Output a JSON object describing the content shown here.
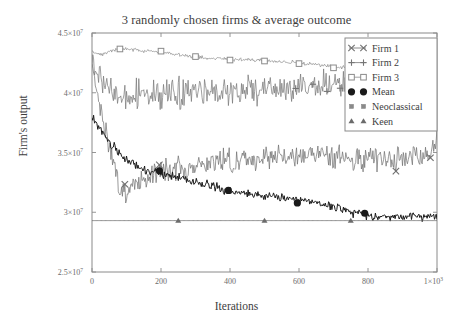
{
  "chart_data": {
    "type": "line",
    "title": "3 randomly chosen firms & average outcome",
    "xlabel": "Iterations",
    "ylabel": "Firm's output",
    "xlim": [
      0,
      1000
    ],
    "ylim": [
      25000000,
      45000000
    ],
    "grid": false,
    "legend_position": "top-right",
    "xticks": [
      0,
      200,
      400,
      600,
      800,
      1000
    ],
    "xtick_labels": [
      "0",
      "200",
      "400",
      "600",
      "800",
      "1×10³"
    ],
    "yticks": [
      25000000,
      30000000,
      35000000,
      40000000,
      45000000
    ],
    "ytick_labels": [
      "2.5×10⁷",
      "3×10⁷",
      "3.5×10⁷",
      "4×10⁷",
      "4.5×10⁷"
    ],
    "series": [
      {
        "name": "Firm 1",
        "marker": "x",
        "color": "#6e6e6e",
        "linewidth": 0.7,
        "noise": 700000,
        "seed": 17,
        "marker_x": [
          95,
          195,
          880,
          980
        ],
        "anchors": [
          {
            "x": 0,
            "y": 42500000
          },
          {
            "x": 40,
            "y": 36500000
          },
          {
            "x": 80,
            "y": 32200000
          },
          {
            "x": 100,
            "y": 31600000
          },
          {
            "x": 140,
            "y": 32600000
          },
          {
            "x": 200,
            "y": 33600000
          },
          {
            "x": 300,
            "y": 33900000
          },
          {
            "x": 400,
            "y": 34300000
          },
          {
            "x": 500,
            "y": 34600000
          },
          {
            "x": 600,
            "y": 34700000
          },
          {
            "x": 700,
            "y": 34600000
          },
          {
            "x": 800,
            "y": 34500000
          },
          {
            "x": 900,
            "y": 34500000
          },
          {
            "x": 980,
            "y": 35000000
          },
          {
            "x": 1000,
            "y": 36500000
          }
        ]
      },
      {
        "name": "Firm 2",
        "marker": "plus",
        "color": "#757575",
        "linewidth": 0.7,
        "noise": 880000,
        "seed": 53,
        "marker_x": [
          590,
          640,
          680,
          720,
          760,
          800,
          840,
          880
        ],
        "anchors": [
          {
            "x": 0,
            "y": 43000000
          },
          {
            "x": 20,
            "y": 41500000
          },
          {
            "x": 60,
            "y": 39800000
          },
          {
            "x": 100,
            "y": 39700000
          },
          {
            "x": 200,
            "y": 39900000
          },
          {
            "x": 300,
            "y": 40000000
          },
          {
            "x": 400,
            "y": 40100000
          },
          {
            "x": 500,
            "y": 40200000
          },
          {
            "x": 600,
            "y": 40500000
          },
          {
            "x": 700,
            "y": 40600000
          },
          {
            "x": 800,
            "y": 40700000
          },
          {
            "x": 900,
            "y": 40700000
          },
          {
            "x": 990,
            "y": 41000000
          },
          {
            "x": 1000,
            "y": 42600000
          }
        ]
      },
      {
        "name": "Firm 3",
        "marker": "square",
        "color": "#8a8a8a",
        "linewidth": 0.7,
        "noise": 110000,
        "seed": 91,
        "marker_x": [
          80,
          200,
          300,
          400,
          500,
          600,
          700,
          770,
          840,
          900,
          950
        ],
        "anchors": [
          {
            "x": 0,
            "y": 43400000
          },
          {
            "x": 30,
            "y": 43200000
          },
          {
            "x": 80,
            "y": 43700000
          },
          {
            "x": 150,
            "y": 43500000
          },
          {
            "x": 200,
            "y": 43400000
          },
          {
            "x": 300,
            "y": 43000000
          },
          {
            "x": 400,
            "y": 42800000
          },
          {
            "x": 500,
            "y": 42700000
          },
          {
            "x": 600,
            "y": 42500000
          },
          {
            "x": 700,
            "y": 42200000
          },
          {
            "x": 800,
            "y": 42100000
          },
          {
            "x": 900,
            "y": 42100000
          },
          {
            "x": 1000,
            "y": 42000000
          }
        ]
      },
      {
        "name": "Mean",
        "marker": "circle",
        "color": "#1a1a1a",
        "linewidth": 1.0,
        "noise": 270000,
        "seed": 31,
        "marker_x": [
          195,
          395,
          595,
          790
        ],
        "anchors": [
          {
            "x": 0,
            "y": 38000000
          },
          {
            "x": 40,
            "y": 36200000
          },
          {
            "x": 80,
            "y": 34900000
          },
          {
            "x": 120,
            "y": 34000000
          },
          {
            "x": 160,
            "y": 33500000
          },
          {
            "x": 200,
            "y": 33300000
          },
          {
            "x": 300,
            "y": 32500000
          },
          {
            "x": 400,
            "y": 31700000
          },
          {
            "x": 500,
            "y": 31400000
          },
          {
            "x": 600,
            "y": 31100000
          },
          {
            "x": 700,
            "y": 30500000
          },
          {
            "x": 800,
            "y": 29700000
          },
          {
            "x": 900,
            "y": 29600000
          },
          {
            "x": 1000,
            "y": 29700000
          }
        ]
      },
      {
        "name": "Neoclassical",
        "marker": "smallsquare",
        "color": "#8a8a8a",
        "linewidth": 0.7,
        "noise": 0,
        "seed": 5,
        "marker_x": [],
        "anchors": []
      },
      {
        "name": "Keen",
        "marker": "triangle",
        "color": "#6b6b6b",
        "linewidth": 0.8,
        "noise": 0,
        "seed": 7,
        "marker_x": [
          250,
          500,
          750
        ],
        "anchors": [
          {
            "x": 0,
            "y": 29300000
          },
          {
            "x": 1000,
            "y": 29300000
          }
        ]
      }
    ]
  },
  "legend": {
    "entries": [
      {
        "label": "Firm 1",
        "marker": "x"
      },
      {
        "label": "Firm 2",
        "marker": "plus"
      },
      {
        "label": "Firm 3",
        "marker": "square"
      },
      {
        "label": "Mean",
        "marker": "circle"
      },
      {
        "label": "Neoclassical",
        "marker": "smallsquare"
      },
      {
        "label": "Keen",
        "marker": "triangle"
      }
    ]
  },
  "colors": {
    "background": "#ffffff",
    "axis": "#8a8a8a",
    "text": "#3d3d3d",
    "mean": "#1a1a1a"
  }
}
